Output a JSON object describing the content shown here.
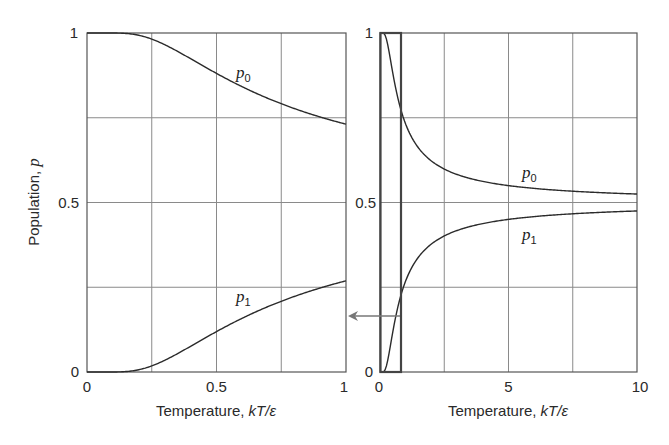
{
  "chart_data": [
    {
      "type": "line",
      "panel": "left",
      "title": "",
      "xlabel": "Temperature, kT/ε",
      "ylabel": "Population, p",
      "xlim": [
        0,
        1
      ],
      "ylim": [
        0,
        1
      ],
      "x_ticks": [
        "0",
        "0.5",
        "1"
      ],
      "y_ticks": [
        "0",
        "0.5",
        "1"
      ],
      "grid": true,
      "x_grid": [
        0,
        0.25,
        0.5,
        0.75,
        1
      ],
      "y_grid": [
        0,
        0.25,
        0.5,
        0.75,
        1
      ],
      "x": [
        0,
        0.1,
        0.2,
        0.3,
        0.4,
        0.5,
        0.6,
        0.7,
        0.8,
        0.9,
        1.0
      ],
      "series": [
        {
          "name": "p0",
          "values": [
            1.0,
            1.0,
            0.993,
            0.966,
            0.924,
            0.881,
            0.841,
            0.806,
            0.777,
            0.752,
            0.731
          ]
        },
        {
          "name": "p1",
          "values": [
            0.0,
            0.0,
            0.007,
            0.034,
            0.076,
            0.119,
            0.159,
            0.194,
            0.223,
            0.248,
            0.269
          ]
        }
      ],
      "annotations": [
        "p0",
        "p1"
      ]
    },
    {
      "type": "line",
      "panel": "right",
      "title": "",
      "xlabel": "Temperature, kT/ε",
      "ylabel": "",
      "xlim": [
        0,
        10
      ],
      "ylim": [
        0,
        1
      ],
      "x_ticks": [
        "0",
        "5",
        "10"
      ],
      "y_ticks": [
        "0",
        "0.5",
        "1"
      ],
      "grid": true,
      "x_grid": [
        0,
        2.5,
        5,
        7.5,
        10
      ],
      "y_grid": [
        0,
        0.25,
        0.5,
        0.75,
        1
      ],
      "x": [
        0,
        0.5,
        1,
        2,
        3,
        4,
        5,
        6,
        7,
        8,
        9,
        10
      ],
      "series": [
        {
          "name": "p0",
          "values": [
            1.0,
            0.881,
            0.731,
            0.622,
            0.583,
            0.562,
            0.55,
            0.542,
            0.536,
            0.531,
            0.528,
            0.525
          ]
        },
        {
          "name": "p1",
          "values": [
            0.0,
            0.119,
            0.269,
            0.378,
            0.417,
            0.438,
            0.45,
            0.458,
            0.464,
            0.469,
            0.472,
            0.475
          ]
        }
      ],
      "annotations": [
        "p0",
        "p1"
      ],
      "highlight_box": {
        "x_range": [
          0,
          0.8
        ],
        "y_range": [
          0,
          1
        ]
      },
      "arrow": {
        "from_panel": "right",
        "to_panel": "left",
        "y": 0.22
      }
    }
  ],
  "labels": {
    "y_axis": "Population, ",
    "y_axis_var": "p",
    "x_axis_text": "Temperature, ",
    "x_axis_var": "kT/ε",
    "left_ticks_x": [
      "0",
      "0.5",
      "1"
    ],
    "right_ticks_x": [
      "0",
      "5",
      "10"
    ],
    "ticks_y": [
      "0",
      "0.5",
      "1"
    ],
    "curve_p": "p",
    "sub0": "0",
    "sub1": "1"
  }
}
